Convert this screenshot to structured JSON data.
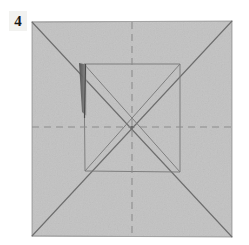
{
  "figure": {
    "type": "origami-step-diagram",
    "step_number": "4",
    "caption": "",
    "canvas": {
      "width": 249,
      "height": 245,
      "background_color": "#ffffff"
    }
  },
  "paper": {
    "name": "square-sheet",
    "fill_color": "#c2c2c2",
    "edge_color": "#9a9a9a",
    "corners": {
      "top_left": [
        32,
        22
      ],
      "top_right": [
        232,
        21
      ],
      "bottom_right": [
        232,
        237
      ],
      "bottom_left": [
        32,
        236
      ]
    }
  },
  "creases": {
    "mountain_valley_legend": {
      "solid_label": "crease line",
      "dashed_label": "valley fold line"
    },
    "solid_color": "#6e6e6e",
    "dashed_color": "#8e8e8e",
    "outer_diagonals": [
      {
        "name": "diagonal-tl-br",
        "from": [
          32,
          22
        ],
        "to": [
          232,
          237
        ]
      },
      {
        "name": "diagonal-tr-bl",
        "from": [
          232,
          21
        ],
        "to": [
          32,
          236
        ]
      }
    ],
    "center_lines": [
      {
        "name": "horizontal-center-dashed",
        "from": [
          32,
          127
        ],
        "to": [
          232,
          127
        ],
        "style": "dashed"
      },
      {
        "name": "vertical-center-dashed",
        "from": [
          132,
          22
        ],
        "to": [
          132,
          237
        ],
        "style": "dashed"
      }
    ],
    "inner_square": {
      "name": "inner-square-crease",
      "top_left": [
        84,
        64
      ],
      "top_right": [
        180,
        64
      ],
      "bottom_right": [
        180,
        172
      ],
      "bottom_left": [
        85,
        171
      ],
      "style": "solid"
    },
    "inner_diagonals": [
      {
        "name": "inner-diagonal-tl-br",
        "from": [
          84,
          64
        ],
        "to": [
          180,
          172
        ]
      },
      {
        "name": "inner-diagonal-tr-bl",
        "from": [
          180,
          64
        ],
        "to": [
          85,
          171
        ]
      }
    ]
  },
  "shadow": {
    "name": "lifted-flap-shadow",
    "color": "#5c5c5c",
    "points": "79,63 86,64 86,116 82,112"
  },
  "center_point": {
    "x": 132,
    "y": 127
  }
}
